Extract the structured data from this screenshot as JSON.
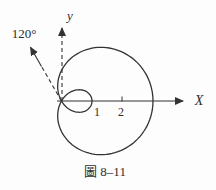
{
  "figure": {
    "caption": "圖 8–11",
    "labels": {
      "x_axis": "X",
      "y_axis": "y",
      "angle": "120°",
      "tick_1": "1",
      "tick_2": "2"
    },
    "plot": {
      "curve": {
        "type": "limacon",
        "polar_form": "r = a + b·cos(θ)",
        "a": 1,
        "b": 2,
        "x_intercepts": [
          1,
          3
        ]
      },
      "angle_degrees": 120,
      "x_ticks": [
        1,
        2
      ],
      "origin_px": [
        61.5,
        101
      ],
      "unit_px": 30.5
    },
    "colors": {
      "stroke": "#333333",
      "background": "#fdfdfd"
    }
  }
}
